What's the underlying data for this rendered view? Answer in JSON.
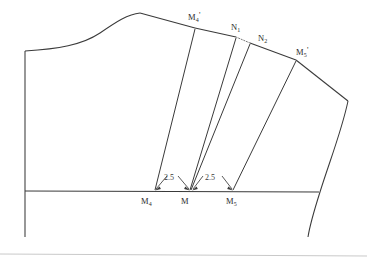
{
  "diagram": {
    "stroke_color": "#3a3a3a",
    "background_color": "#ffffff",
    "labels": {
      "m4_prime": {
        "base": "M",
        "sub": "4",
        "prime": "'"
      },
      "n1": {
        "base": "N",
        "sub": "1",
        "prime": ""
      },
      "n2": {
        "base": "N",
        "sub": "2",
        "prime": ""
      },
      "m5_prime": {
        "base": "M",
        "sub": "5",
        "prime": "'"
      },
      "m4": {
        "base": "M",
        "sub": "4",
        "prime": ""
      },
      "m": {
        "base": "M",
        "sub": "",
        "prime": ""
      },
      "m5": {
        "base": "M",
        "sub": "5",
        "prime": ""
      }
    },
    "dimensions": [
      {
        "name": "left-dart-spread",
        "value": "2.5"
      },
      {
        "name": "right-dart-spread",
        "value": "2.5"
      }
    ]
  }
}
